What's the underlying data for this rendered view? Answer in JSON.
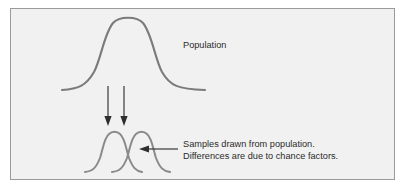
{
  "figure": {
    "labels": {
      "population": "Population",
      "caption_line1": "Samples drawn from population.",
      "caption_line2": "Differences are due to chance factors."
    },
    "colors": {
      "background": "#ffffff",
      "panel_fill": "#f1f1f1",
      "panel_border": "#9a9a9a",
      "curve_stroke": "#7b7b7b",
      "sample_curve_stroke": "#8a8a8a",
      "arrow": "#2e2e2e",
      "text": "#2b2b2b"
    },
    "elements": {
      "population_curve_name": "population-distribution-curve",
      "sample_curve_1_name": "sample-distribution-curve-1",
      "sample_curve_2_name": "sample-distribution-curve-2",
      "down_arrow_1_name": "sampling-arrow-left",
      "down_arrow_2_name": "sampling-arrow-right",
      "pointer_arrow_name": "caption-pointer-arrow"
    }
  }
}
